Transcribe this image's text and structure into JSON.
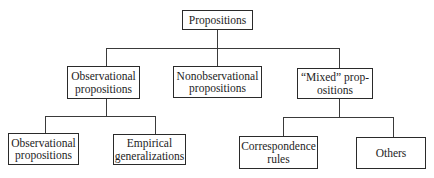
{
  "diagram": {
    "type": "tree",
    "root": {
      "label": "Propositions",
      "lines": [
        "Propositions"
      ]
    },
    "level2": [
      {
        "id": "observational",
        "label": "Observational propositions",
        "lines": [
          "Observational",
          "propositions"
        ]
      },
      {
        "id": "nonobservational",
        "label": "Nonobservational propositions",
        "lines": [
          "Nonobservational",
          "propositions"
        ]
      },
      {
        "id": "mixed",
        "label": "“Mixed” propositions",
        "lines": [
          "“Mixed” prop-",
          "ositions"
        ]
      }
    ],
    "level3": {
      "observational": [
        {
          "label": "Observational propositions",
          "lines": [
            "Observational",
            "propositions"
          ]
        },
        {
          "label": "Empirical generalizations",
          "lines": [
            "Empirical",
            "generalizations"
          ]
        }
      ],
      "mixed": [
        {
          "label": "Correspondence rules",
          "lines": [
            "Correspondence",
            "rules"
          ]
        },
        {
          "label": "Others",
          "lines": [
            "Others"
          ]
        }
      ]
    },
    "edges": [
      [
        "Propositions",
        "Observational propositions"
      ],
      [
        "Propositions",
        "Nonobservational propositions"
      ],
      [
        "Propositions",
        "“Mixed” propositions"
      ],
      [
        "Observational propositions",
        "Observational propositions (child)"
      ],
      [
        "Observational propositions",
        "Empirical generalizations"
      ],
      [
        "“Mixed” propositions",
        "Correspondence rules"
      ],
      [
        "“Mixed” propositions",
        "Others"
      ]
    ]
  }
}
